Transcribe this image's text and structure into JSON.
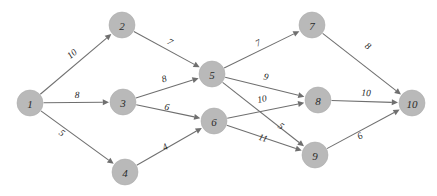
{
  "diagram": {
    "type": "directed-weighted-graph",
    "canvas": {
      "width": 437,
      "height": 196,
      "background": "#ffffff"
    },
    "style": {
      "node_fill": "#b9b9b9",
      "node_stroke": "#adadad",
      "node_radius": 13,
      "edge_color": "#6f6f6f",
      "label_color": "#2b2b2b",
      "weight_color": "#1f1f1f"
    },
    "nodes": [
      {
        "id": "n1",
        "label": "1",
        "x": 30,
        "y": 103
      },
      {
        "id": "n2",
        "label": "2",
        "x": 122,
        "y": 25
      },
      {
        "id": "n3",
        "label": "3",
        "x": 123,
        "y": 102
      },
      {
        "id": "n4",
        "label": "4",
        "x": 125,
        "y": 172
      },
      {
        "id": "n5",
        "label": "5",
        "x": 212,
        "y": 74
      },
      {
        "id": "n6",
        "label": "6",
        "x": 214,
        "y": 121
      },
      {
        "id": "n7",
        "label": "7",
        "x": 312,
        "y": 25
      },
      {
        "id": "n8",
        "label": "8",
        "x": 318,
        "y": 100
      },
      {
        "id": "n9",
        "label": "9",
        "x": 315,
        "y": 155
      },
      {
        "id": "n10",
        "label": "10",
        "x": 412,
        "y": 103
      }
    ],
    "edges": [
      {
        "id": "e1-2",
        "from": "n1",
        "to": "n2",
        "weight": "10",
        "lx": 72,
        "ly": 54
      },
      {
        "id": "e1-3",
        "from": "n1",
        "to": "n3",
        "weight": "8",
        "lx": 77,
        "ly": 95
      },
      {
        "id": "e1-4",
        "from": "n1",
        "to": "n4",
        "weight": "5",
        "lx": 62,
        "ly": 133
      },
      {
        "id": "e2-5",
        "from": "n2",
        "to": "n5",
        "weight": "7",
        "lx": 170,
        "ly": 42
      },
      {
        "id": "e3-5",
        "from": "n3",
        "to": "n5",
        "weight": "8",
        "lx": 164,
        "ly": 79
      },
      {
        "id": "e3-6",
        "from": "n3",
        "to": "n6",
        "weight": "6",
        "lx": 167,
        "ly": 107
      },
      {
        "id": "e4-6",
        "from": "n4",
        "to": "n6",
        "weight": "4",
        "lx": 165,
        "ly": 147
      },
      {
        "id": "e5-7",
        "from": "n5",
        "to": "n7",
        "weight": "7",
        "lx": 258,
        "ly": 43
      },
      {
        "id": "e5-8",
        "from": "n5",
        "to": "n8",
        "weight": "9",
        "lx": 266,
        "ly": 77
      },
      {
        "id": "e5-9",
        "from": "n5",
        "to": "n9",
        "weight": "5",
        "lx": 281,
        "ly": 126
      },
      {
        "id": "e6-8",
        "from": "n6",
        "to": "n8",
        "weight": "10",
        "lx": 262,
        "ly": 99
      },
      {
        "id": "e6-9",
        "from": "n6",
        "to": "n9",
        "weight": "11",
        "lx": 263,
        "ly": 138
      },
      {
        "id": "e7-10",
        "from": "n7",
        "to": "n10",
        "weight": "8",
        "lx": 368,
        "ly": 46
      },
      {
        "id": "e8-10",
        "from": "n8",
        "to": "n10",
        "weight": "10",
        "lx": 366,
        "ly": 93
      },
      {
        "id": "e9-10",
        "from": "n9",
        "to": "n10",
        "weight": "6",
        "lx": 360,
        "ly": 136
      }
    ]
  }
}
